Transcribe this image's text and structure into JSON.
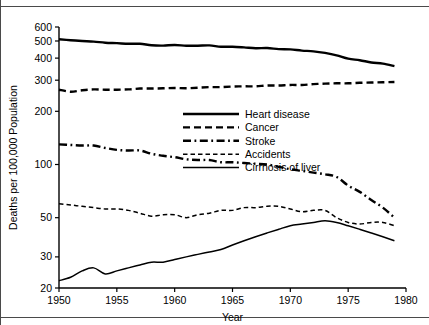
{
  "chart_data": {
    "type": "line",
    "title": "",
    "xlabel": "Year",
    "ylabel": "Deaths per 100,000 Population",
    "xlim": [
      1950,
      1980
    ],
    "ylim": [
      20,
      600
    ],
    "yscale": "log",
    "xscale": "linear",
    "grid": false,
    "legend_position": "upper-center-right",
    "xticks": [
      1950,
      1955,
      1960,
      1965,
      1970,
      1975,
      1980
    ],
    "xtick_labels": [
      "1950",
      "1955",
      "1960",
      "1965",
      "1970",
      "1975",
      "1980"
    ],
    "yticks": [
      20,
      30,
      50,
      100,
      200,
      300,
      400,
      500,
      600
    ],
    "ytick_labels": [
      "20",
      "30",
      "50",
      "100",
      "200",
      "300",
      "400",
      "500",
      "600"
    ],
    "x": [
      1950,
      1951,
      1952,
      1953,
      1954,
      1955,
      1956,
      1957,
      1958,
      1959,
      1960,
      1961,
      1962,
      1963,
      1964,
      1965,
      1966,
      1967,
      1968,
      1969,
      1970,
      1971,
      1972,
      1973,
      1974,
      1975,
      1976,
      1977,
      1978,
      1979
    ],
    "series": [
      {
        "name": "Heart disease",
        "style": "solid-thick",
        "values": [
          511,
          505,
          500,
          496,
          489,
          486,
          482,
          482,
          473,
          471,
          475,
          470,
          470,
          472,
          464,
          464,
          460,
          455,
          456,
          450,
          448,
          441,
          437,
          428,
          415,
          397,
          389,
          378,
          372,
          360
        ]
      },
      {
        "name": "Cancer",
        "style": "dashed",
        "values": [
          265,
          258,
          263,
          266,
          265,
          265,
          266,
          269,
          269,
          270,
          271,
          270,
          272,
          274,
          274,
          276,
          277,
          277,
          280,
          280,
          282,
          282,
          285,
          287,
          288,
          288,
          290,
          291,
          292,
          293
        ]
      },
      {
        "name": "Stroke",
        "style": "dash-dot",
        "values": [
          130,
          129,
          128,
          128,
          124,
          121,
          120,
          120,
          115,
          112,
          110,
          107,
          106,
          106,
          103,
          103,
          102,
          101,
          100,
          97,
          94,
          92,
          90,
          88,
          85,
          76,
          70,
          63,
          57,
          50
        ]
      },
      {
        "name": "Accidents",
        "style": "fine-dashed",
        "values": [
          60,
          59,
          58,
          57,
          56,
          56,
          55,
          53,
          51,
          52,
          52,
          50,
          52,
          53,
          55,
          55,
          57,
          57,
          58,
          58,
          56,
          54,
          55,
          55,
          50,
          47,
          46,
          47,
          47,
          45
        ]
      },
      {
        "name": "Cirrhosis of liver",
        "style": "solid-thin",
        "values": [
          22,
          23,
          25,
          26,
          24,
          25,
          26,
          27,
          28,
          28,
          29,
          30,
          31,
          32,
          33,
          35,
          37,
          39,
          41,
          43,
          45,
          46,
          47,
          48,
          47,
          45,
          43,
          41,
          39,
          37
        ]
      }
    ]
  },
  "legend": {
    "entries": [
      {
        "label": "Heart disease"
      },
      {
        "label": "Cancer"
      },
      {
        "label": "Stroke"
      },
      {
        "label": "Accidents"
      },
      {
        "label": "Cirrhosis of liver"
      }
    ]
  }
}
